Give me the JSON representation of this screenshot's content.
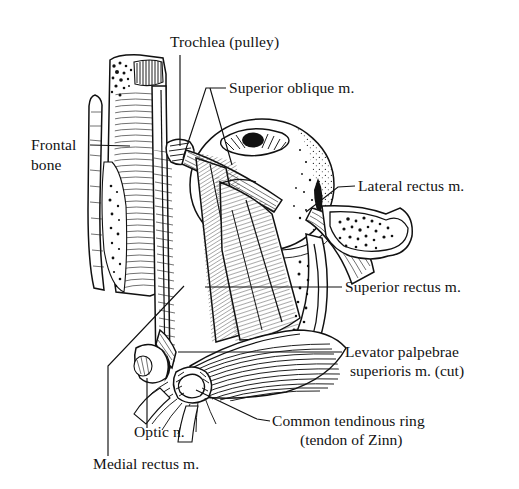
{
  "figure": {
    "style": "black-and-white engraved line drawing",
    "background_color": "#ffffff",
    "ink_color": "#111111",
    "width": 519,
    "height": 489
  },
  "labels": [
    {
      "id": "trochlea",
      "name": "trochlea-label",
      "text": "Trochlea (pulley)",
      "lines": [
        "Trochlea (pulley)"
      ],
      "anchor": "start",
      "x": 170,
      "y": 47,
      "leader": "M 180 55 L 180 112 L 180 150"
    },
    {
      "id": "superior-oblique",
      "name": "superior-oblique-label",
      "text": "Superior oblique m.",
      "lines": [
        "Superior oblique m."
      ],
      "anchor": "start",
      "x": 229,
      "y": 93,
      "leader": "M 226 88 L 206 88"
    },
    {
      "id": "frontal-bone",
      "name": "frontal-bone-label",
      "text": "Frontal bone",
      "lines": [
        "Frontal",
        "bone"
      ],
      "anchor": "start",
      "x": 31,
      "y": 150,
      "leader": "M 90 145 L 128 145"
    },
    {
      "id": "lateral-rectus",
      "name": "lateral-rectus-label",
      "text": "Lateral rectus m.",
      "lines": [
        "Lateral rectus m."
      ],
      "anchor": "start",
      "x": 358,
      "y": 190,
      "leader": "M 355 186 L 338 186"
    },
    {
      "id": "superior-rectus",
      "name": "superior-rectus-label",
      "text": "Superior rectus m.",
      "lines": [
        "Superior rectus m."
      ],
      "anchor": "start",
      "x": 345,
      "y": 291,
      "leader": "M 342 287 L 205 287"
    },
    {
      "id": "levator-palpebrae",
      "name": "levator-palpebrae-label",
      "text": "Levator palpebrae superioris m. (cut)",
      "lines": [
        "Levator palpebrae",
        "superioris m. (cut)"
      ],
      "anchor": "start",
      "x": 345,
      "y": 357,
      "leader": "M 342 352 L 178 352"
    },
    {
      "id": "common-tendinous-ring",
      "name": "common-tendinous-ring-label",
      "text": "Common tendinous ring (tendon of Zinn)",
      "lines": [
        "Common tendinous ring",
        "(tendon of Zinn)"
      ],
      "anchor": "start",
      "x": 272,
      "y": 425,
      "leader": "M 270 420 L 258 420"
    },
    {
      "id": "optic-nerve",
      "name": "optic-nerve-label",
      "text": "Optic n.",
      "lines": [
        "Optic n."
      ],
      "anchor": "start",
      "x": 134,
      "y": 437,
      "leader": "M 147 429 L 147 378"
    },
    {
      "id": "medial-rectus",
      "name": "medial-rectus-label",
      "text": "Medial rectus m.",
      "lines": [
        "Medial rectus m."
      ],
      "anchor": "start",
      "x": 93,
      "y": 468,
      "leader": "M 108 455 L 108 366 L 182 287"
    }
  ],
  "structures": [
    {
      "id": "frontal-bone",
      "name": "frontal-bone-cross-section",
      "description": "Cut frontal bone with cancellous stipple and dense hatching"
    },
    {
      "id": "globe",
      "name": "eyeball-globe",
      "description": "Eyeball with cornea and pupil, stippled sclera"
    },
    {
      "id": "superior-oblique-tendon",
      "name": "superior-oblique-tendon",
      "description": "Tendon passing through the trochlea"
    },
    {
      "id": "superior-oblique-belly",
      "name": "superior-oblique-muscle-belly",
      "description": "Long striated muscle belly running posteriorly"
    },
    {
      "id": "superior-rectus-belly",
      "name": "superior-rectus-muscle-belly",
      "description": "Broad striated muscle belly over the globe"
    },
    {
      "id": "levator-palpebrae",
      "name": "levator-palpebrae-superioris-cut",
      "description": "Cut and reflected fan of levator fibers"
    },
    {
      "id": "lateral-orbital-wall",
      "name": "lateral-orbital-wall-bone",
      "description": "Lateral orbital wall bone with marrow stipple"
    },
    {
      "id": "common-tendinous-ring",
      "name": "common-tendinous-ring",
      "description": "Annulus of Zinn at orbital apex"
    },
    {
      "id": "optic-nerve",
      "name": "optic-nerve-stub",
      "description": "Cut optic nerve cylinder"
    },
    {
      "id": "medial-rectus",
      "name": "medial-rectus-muscle",
      "description": "Medial rectus along the medial orbital wall"
    }
  ]
}
